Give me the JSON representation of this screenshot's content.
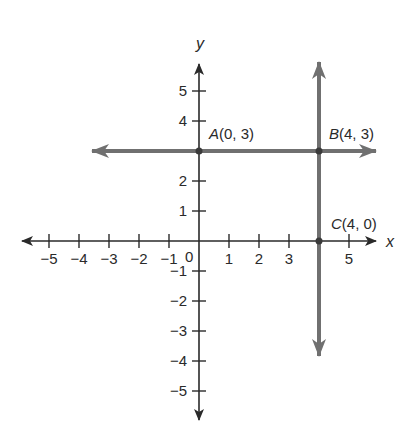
{
  "diagram": {
    "type": "coordinate-plane",
    "origin_px": [
      199,
      241
    ],
    "unit_px": 30,
    "axes": {
      "x": {
        "name": "x",
        "min": -5,
        "max": 5,
        "color": "#2a2a2a"
      },
      "y": {
        "name": "y",
        "min": -5,
        "max": 5,
        "color": "#2a2a2a"
      }
    },
    "x_tick_labels": [
      {
        "v": -5,
        "label": "−5"
      },
      {
        "v": -4,
        "label": "−4"
      },
      {
        "v": -3,
        "label": "−3"
      },
      {
        "v": -2,
        "label": "−2"
      },
      {
        "v": -1,
        "label": "−1"
      },
      {
        "v": 1,
        "label": "1"
      },
      {
        "v": 2,
        "label": "2"
      },
      {
        "v": 3,
        "label": "3"
      },
      {
        "v": 5,
        "label": "5"
      }
    ],
    "y_tick_labels": [
      {
        "v": 5,
        "label": "5"
      },
      {
        "v": 4,
        "label": "4"
      },
      {
        "v": 2,
        "label": "2"
      },
      {
        "v": 1,
        "label": "1"
      },
      {
        "v": -1,
        "label": "−1"
      },
      {
        "v": -2,
        "label": "−2"
      },
      {
        "v": -3,
        "label": "−3"
      },
      {
        "v": -4,
        "label": "−4"
      },
      {
        "v": -5,
        "label": "−5"
      }
    ],
    "origin_label": "0",
    "lines": [
      {
        "name": "horizontal-line-y3",
        "equation": "y = 3",
        "color": "#707070"
      },
      {
        "name": "vertical-line-x4",
        "equation": "x = 4",
        "color": "#707070"
      }
    ],
    "points": [
      {
        "letter": "A",
        "coords": "(0, 3)",
        "x": 0,
        "y": 3
      },
      {
        "letter": "B",
        "coords": "(4, 3)",
        "x": 4,
        "y": 3
      },
      {
        "letter": "C",
        "coords": "(4, 0)",
        "x": 4,
        "y": 0
      }
    ]
  }
}
